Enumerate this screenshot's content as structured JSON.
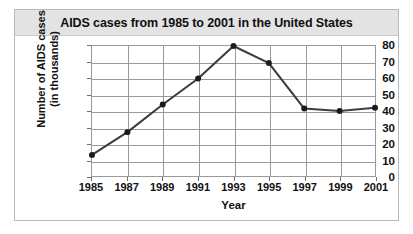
{
  "chart_data": {
    "type": "line",
    "title": "AIDS cases from 1985 to 2001 in the United States",
    "xlabel": "Year",
    "ylabel_line1": "Number of AIDS cases",
    "ylabel_line2": "(in thousands)",
    "x": [
      1985,
      1987,
      1989,
      1991,
      1993,
      1995,
      1997,
      1999,
      2001
    ],
    "categories": [
      "1985",
      "1987",
      "1989",
      "1991",
      "1993",
      "1995",
      "1997",
      "1999",
      "2001"
    ],
    "values": [
      13,
      27,
      44,
      60,
      80,
      69.5,
      41.5,
      40,
      42
    ],
    "series": [
      {
        "name": "AIDS cases",
        "values": [
          13,
          27,
          44,
          60,
          80,
          69.5,
          41.5,
          40,
          42
        ]
      }
    ],
    "yticks": [
      0,
      10,
      20,
      30,
      40,
      50,
      60,
      70,
      80
    ],
    "ytick_labels": [
      "0",
      "10",
      "20",
      "30",
      "40",
      "50",
      "60",
      "70",
      "80"
    ],
    "ylim": [
      0,
      80
    ],
    "xlim": [
      1985,
      2001
    ],
    "grid": true,
    "legend": false,
    "marker": "circle",
    "line_color": "#3d3d3d",
    "marker_color": "#1a1a1a",
    "grid_color": "#9a9a9a",
    "title_bar_color": "#e3e3e3",
    "frame_color": "#b9b9b9",
    "plot_background": "#ffffff"
  }
}
